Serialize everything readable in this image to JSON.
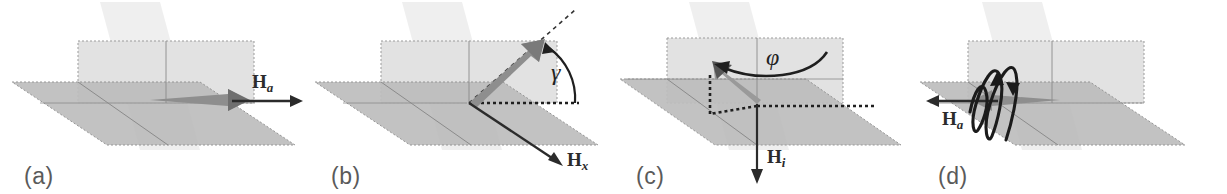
{
  "figure": {
    "panel_count": 4,
    "background": "#ffffff"
  },
  "colors": {
    "film_plane": "#b8b8b8",
    "film_plane_edge": "#8f8f8f",
    "vertical_plane": "#dedede",
    "back_plane": "#ebebeb",
    "magnetization_arrow": "#9a9a9a",
    "magnetization_arrow_dark": "#6f6f6f",
    "field_arrow": "#2b2b2b",
    "panel_label": "#5a5a5a",
    "dashed_outline": "#9b9b9b"
  },
  "panels": [
    {
      "id": "a",
      "label": "(a)",
      "description": "In-plane magnetization saturated along applied field",
      "field_label": "H",
      "field_subscript": "a",
      "field_direction": "right",
      "magnetization_direction": "in-plane-right",
      "angle_symbol": "",
      "has_precession": false
    },
    {
      "id": "b",
      "label": "(b)",
      "description": "Magnetization tilted out of plane by angle gamma",
      "field_label": "H",
      "field_subscript": "x",
      "field_direction": "down-right-front",
      "magnetization_direction": "tilted-up-right",
      "angle_symbol": "γ",
      "has_precession": false
    },
    {
      "id": "c",
      "label": "(c)",
      "description": "Magnetization rotated in-plane by azimuthal angle phi with internal field",
      "field_label": "H",
      "field_subscript": "i",
      "field_direction": "down",
      "magnetization_direction": "up-left",
      "angle_symbol": "φ",
      "has_precession": false
    },
    {
      "id": "d",
      "label": "(d)",
      "description": "Precession of magnetization about applied field",
      "field_label": "H",
      "field_subscript": "a",
      "field_direction": "left",
      "magnetization_direction": "in-plane-left",
      "angle_symbol": "",
      "has_precession": true
    }
  ]
}
